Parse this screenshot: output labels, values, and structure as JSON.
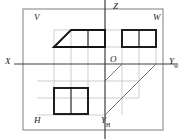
{
  "diagram": {
    "type": "engineering-projection-diagram",
    "background_color": "#ffffff",
    "grid_color": "#b5b5b5",
    "outline_color": "#7a7a7a",
    "solid_color": "#1a1a1a",
    "axis_color": "#4a4a4a",
    "labels": {
      "plane_v": "V",
      "plane_w": "W",
      "plane_h": "H",
      "axis_z": "Z",
      "axis_x": "X",
      "origin": "O",
      "axis_y_w": "Y",
      "axis_y_w_sub": "w",
      "axis_y_h": "Y",
      "axis_y_h_sub": "H"
    },
    "frame": {
      "x": 23,
      "y": 9,
      "width": 140,
      "height": 121
    },
    "axes": {
      "z_axis": {
        "x": 105,
        "y1": 0,
        "y2": 139
      },
      "x_axis": {
        "y": 64,
        "x1": 14,
        "x2": 178
      },
      "origin_point": {
        "x": 105,
        "y": 64
      }
    },
    "grid": {
      "cell": 17,
      "vertical_x": [
        54,
        71,
        88,
        105,
        122,
        139
      ],
      "horizontal_y": [
        30,
        47,
        64,
        81,
        98,
        115
      ]
    },
    "shapes": [
      {
        "name": "v-view-trapezoid-top",
        "plane": "V",
        "kind": "polygon",
        "stroke": "solid",
        "points": "54,47 71,30 105,30 105,47 54,47"
      },
      {
        "name": "v-view-lower-block",
        "plane": "V",
        "kind": "rect",
        "stroke": "solid",
        "x": 54,
        "y": 47,
        "width": 51,
        "height": 0
      },
      {
        "name": "w-view-square",
        "plane": "W",
        "kind": "rect",
        "stroke": "solid",
        "x": 122,
        "y": 30,
        "width": 34,
        "height": 17
      },
      {
        "name": "h-view-rect",
        "plane": "H",
        "kind": "rect",
        "stroke": "solid",
        "x": 54,
        "y": 88,
        "width": 34,
        "height": 26
      },
      {
        "name": "projection-diagonal-upper",
        "kind": "line",
        "stroke": "thin",
        "x1": 105,
        "y1": 81,
        "x2": 122,
        "y2": 64
      },
      {
        "name": "projection-diagonal-lower",
        "kind": "line",
        "stroke": "thin",
        "x1": 105,
        "y1": 115,
        "x2": 156,
        "y2": 64
      }
    ]
  }
}
